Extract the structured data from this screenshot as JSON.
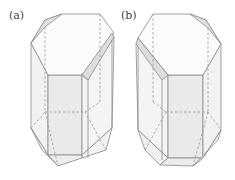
{
  "figure": {
    "panels": [
      {
        "id": "a",
        "label": "(a)"
      },
      {
        "id": "b",
        "label": "(b)"
      }
    ],
    "colors": {
      "edge": "#8a8a8a",
      "hidden_edge": "#9a9a9a",
      "face_light": "#f7f7f7",
      "face_mid": "#ececec",
      "face_dark": "#dcdcdc",
      "background": "#ffffff"
    }
  }
}
